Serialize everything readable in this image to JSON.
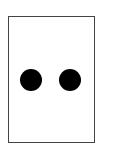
{
  "card": {
    "type": "domino-half",
    "pip_count": 2,
    "border_color": "#444444",
    "background": "#ffffff",
    "pips": [
      {
        "cx": 31,
        "cy": 80,
        "diameter": 22,
        "color": "#000000"
      },
      {
        "cx": 70,
        "cy": 80,
        "diameter": 22,
        "color": "#000000"
      }
    ]
  }
}
